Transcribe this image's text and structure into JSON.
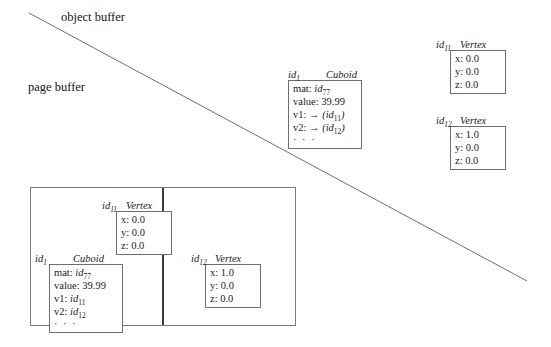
{
  "regions": {
    "object_buffer_label": "object buffer",
    "page_buffer_label": "page buffer"
  },
  "object_buffer": {
    "cuboid": {
      "id": "id",
      "id_sub": "1",
      "type": "Cuboid",
      "fields": [
        {
          "key": "mat:",
          "value": "id",
          "value_sub": "77",
          "arrow": ""
        },
        {
          "key": "value:",
          "value": "39.99",
          "value_sub": "",
          "arrow": ""
        },
        {
          "key": "v1:",
          "value": "(id",
          "value_sub": "11",
          "arrow": "→",
          "close": ")"
        },
        {
          "key": "v2:",
          "value": "(id",
          "value_sub": "12",
          "arrow": "→",
          "close": ")"
        }
      ],
      "ellipsis": "· · ·"
    },
    "vertices": [
      {
        "id": "id",
        "id_sub": "11",
        "type": "Vertex",
        "fields": [
          {
            "key": "x:",
            "value": "0.0"
          },
          {
            "key": "y:",
            "value": "0.0"
          },
          {
            "key": "z:",
            "value": "0.0"
          }
        ]
      },
      {
        "id": "id",
        "id_sub": "12",
        "type": "Vertex",
        "fields": [
          {
            "key": "x:",
            "value": "1.0"
          },
          {
            "key": "y:",
            "value": "0.0"
          },
          {
            "key": "z:",
            "value": "0.0"
          }
        ]
      }
    ]
  },
  "page_buffer": {
    "page_left": {
      "vertex": {
        "id": "id",
        "id_sub": "11",
        "type": "Vertex",
        "fields": [
          {
            "key": "x:",
            "value": "0.0"
          },
          {
            "key": "y:",
            "value": "0.0"
          },
          {
            "key": "z:",
            "value": "0.0"
          }
        ]
      },
      "cuboid": {
        "id": "id",
        "id_sub": "1",
        "type": "Cuboid",
        "fields": [
          {
            "key": "mat:",
            "value": "id",
            "value_sub": "77"
          },
          {
            "key": "value:",
            "value": "39.99",
            "value_sub": ""
          },
          {
            "key": "v1:",
            "value": "id",
            "value_sub": "11"
          },
          {
            "key": "v2:",
            "value": "id",
            "value_sub": "12"
          }
        ],
        "ellipsis": "· · ·"
      }
    },
    "page_right": {
      "vertex": {
        "id": "id",
        "id_sub": "12",
        "type": "Vertex",
        "fields": [
          {
            "key": "x:",
            "value": "1.0"
          },
          {
            "key": "y:",
            "value": "0.0"
          },
          {
            "key": "z:",
            "value": "0.0"
          }
        ]
      }
    }
  },
  "colors": {
    "line": "#6e6e6e",
    "frame": "#7a7a7a",
    "divider": "#3c3c3c",
    "text": "#141414",
    "background": "#ffffff"
  }
}
